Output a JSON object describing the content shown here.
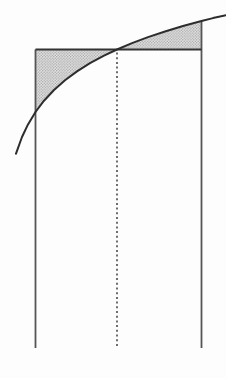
{
  "figure": {
    "canvas": {
      "width": 226,
      "height": 378,
      "background": "#fdfdfd"
    },
    "colors": {
      "curve_stroke": "#2d2d2d",
      "segment_stroke": "#333333",
      "vertical_stroke": "#555555",
      "dotted_stroke": "#4a4a4a",
      "shade_base": "#e8e8e8",
      "shade_dot": "#9f9f9f"
    },
    "stroke_widths": {
      "curve": 2,
      "segment": 1.8,
      "vertical": 1.8,
      "dotted": 1.6
    },
    "curve_points": [
      [
        16,
        153.7
      ],
      [
        22,
        137.0
      ],
      [
        28,
        124.4
      ],
      [
        35.5,
        112.0
      ],
      [
        44,
        100.7
      ],
      [
        54,
        90.0
      ],
      [
        65,
        80.3
      ],
      [
        77,
        71.4
      ],
      [
        90,
        63.2
      ],
      [
        104,
        55.6
      ],
      [
        117,
        49.5
      ],
      [
        132,
        43.1
      ],
      [
        148,
        37.1
      ],
      [
        165,
        31.5
      ],
      [
        183,
        26.0
      ],
      [
        201.5,
        21.0
      ],
      [
        213,
        18.1
      ],
      [
        226,
        15.2
      ]
    ],
    "left_region_points": [
      [
        35.5,
        49.5
      ],
      [
        117,
        49.5
      ],
      [
        104,
        55.6
      ],
      [
        90,
        63.2
      ],
      [
        77,
        71.4
      ],
      [
        65,
        80.3
      ],
      [
        54,
        90.0
      ],
      [
        44,
        100.7
      ],
      [
        35.5,
        112.0
      ]
    ],
    "right_region_points": [
      [
        117,
        49.5
      ],
      [
        132,
        43.1
      ],
      [
        148,
        37.1
      ],
      [
        165,
        31.5
      ],
      [
        183,
        26.0
      ],
      [
        201.5,
        21.0
      ],
      [
        201.5,
        49.5
      ]
    ],
    "horizontal_segment": {
      "x1": 35.5,
      "x2": 201.5,
      "y": 49.5
    },
    "left_vertical_line": {
      "x": 35.5,
      "y1": 49.5,
      "y2": 348
    },
    "right_vertical_line": {
      "x": 201.5,
      "y1": 21,
      "y2": 348
    },
    "dotted_midpoint_line": {
      "x": 117,
      "y1": 52.5,
      "y2": 346,
      "dash": [
        2,
        2.7
      ]
    },
    "stipple": {
      "tile": 2.8,
      "dot_radius": 0.72
    }
  }
}
